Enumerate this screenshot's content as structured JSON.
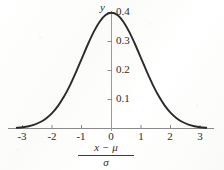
{
  "figure": {
    "name": "standard-normal-density-curve",
    "y_axis_name": "y",
    "x_axis_title_numerator": "x − μ",
    "x_axis_title_denominator": "σ",
    "curve_color": "#2a2a2a",
    "axis_color": "#8a8a8a",
    "text_color": "#2b2b2b",
    "background_color": "#fdfdfc"
  },
  "chart_data": {
    "type": "line",
    "title": "",
    "subtitle": "",
    "xlabel": "(x − μ) / σ",
    "ylabel": "y",
    "xlim": [
      -3.6,
      3.4
    ],
    "ylim": [
      0,
      0.44
    ],
    "grid": false,
    "legend": null,
    "xticks": [
      -3,
      -2,
      -1,
      0,
      1,
      2,
      3
    ],
    "xtick_labels": [
      "-3",
      "-2",
      "-1",
      "0",
      "1",
      "2",
      "3"
    ],
    "yticks": [
      0.1,
      0.2,
      0.3,
      0.4
    ],
    "ytick_labels": [
      "0.1",
      "0.2",
      "0.3",
      "0.4"
    ],
    "series": [
      {
        "name": "standard normal density",
        "x": [
          -3.2,
          -3.0,
          -2.8,
          -2.6,
          -2.4,
          -2.2,
          -2.0,
          -1.8,
          -1.6,
          -1.4,
          -1.2,
          -1.0,
          -0.8,
          -0.6,
          -0.4,
          -0.2,
          0.0,
          0.2,
          0.4,
          0.6,
          0.8,
          1.0,
          1.2,
          1.4,
          1.6,
          1.8,
          2.0,
          2.2,
          2.4,
          2.6,
          2.8,
          3.0,
          3.2
        ],
        "values": [
          0.0024,
          0.0044,
          0.0079,
          0.0136,
          0.0224,
          0.0355,
          0.054,
          0.079,
          0.1109,
          0.1497,
          0.1942,
          0.242,
          0.2897,
          0.3332,
          0.3683,
          0.391,
          0.3989,
          0.391,
          0.3683,
          0.3332,
          0.2897,
          0.242,
          0.1942,
          0.1497,
          0.1109,
          0.079,
          0.054,
          0.0355,
          0.0224,
          0.0136,
          0.0079,
          0.0044,
          0.0024
        ]
      }
    ],
    "peak": {
      "x": 0,
      "y": 0.3989
    },
    "annotations": []
  }
}
